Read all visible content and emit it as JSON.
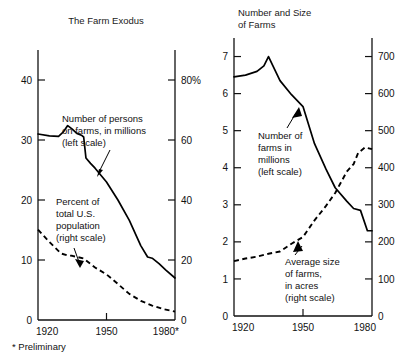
{
  "footnote": "* Preliminary",
  "chart_data": [
    {
      "id": "farm-exodus",
      "type": "line",
      "title": "The Farm Exodus",
      "xlabel": "",
      "ylabel": "",
      "xlim": [
        1920,
        1980
      ],
      "xticks": [
        1920,
        1950,
        1980
      ],
      "xticklabels": [
        "1920",
        "1950",
        "1980*"
      ],
      "ylim": [
        0,
        45
      ],
      "yticks": [
        0,
        10,
        20,
        30,
        40
      ],
      "yticklabels": [
        "0",
        "10",
        "20",
        "30",
        "40"
      ],
      "y2lim": [
        0,
        90
      ],
      "y2ticks": [
        0,
        20,
        40,
        60,
        80
      ],
      "y2ticklabels": [
        "0",
        "20",
        "40",
        "60",
        "80%"
      ],
      "grid": false,
      "legend_position": "annotations",
      "series": [
        {
          "name": "Number of persons on farms, in millions (left scale)",
          "style": "solid",
          "axis": "left",
          "x": [
            1920,
            1925,
            1929,
            1931,
            1933,
            1935,
            1937,
            1939,
            1940,
            1941,
            1943,
            1945,
            1950,
            1955,
            1960,
            1965,
            1968,
            1970,
            1973,
            1976,
            1980
          ],
          "values": [
            31.0,
            30.7,
            30.6,
            31.3,
            32.4,
            31.8,
            31.1,
            30.8,
            30.5,
            27.0,
            26.1,
            25.3,
            23.0,
            20.0,
            16.6,
            12.4,
            10.5,
            10.3,
            9.4,
            8.3,
            7.0
          ]
        },
        {
          "name": "Percent of total U.S. population (right scale)",
          "style": "dashed",
          "axis": "right",
          "x": [
            1920,
            1925,
            1930,
            1933,
            1935,
            1940,
            1945,
            1950,
            1955,
            1960,
            1965,
            1970,
            1975,
            1980
          ],
          "values": [
            30.1,
            26.0,
            22.2,
            21.5,
            21.4,
            20.5,
            17.5,
            15.2,
            12.0,
            8.7,
            6.4,
            4.8,
            3.6,
            2.8
          ]
        }
      ],
      "annotations": [
        {
          "id": "persons-label",
          "lines": [
            "Number of persons",
            "on farms, in millions",
            "(left scale)"
          ],
          "points_to": "solid series"
        },
        {
          "id": "percent-label",
          "lines": [
            "Percent of",
            "total U.S.",
            "population",
            "(right scale)"
          ],
          "points_to": "dashed series"
        }
      ]
    },
    {
      "id": "number-and-size-of-farms",
      "type": "line",
      "title": "Number and Size of Farms",
      "title_lines": [
        "Number and Size",
        "of Farms"
      ],
      "xlabel": "",
      "ylabel": "",
      "xlim": [
        1920,
        1980
      ],
      "xticks": [
        1920,
        1950,
        1980
      ],
      "xticklabels": [
        "1920",
        "1950",
        "1980"
      ],
      "ylim": [
        0,
        7.5
      ],
      "yticks": [
        0,
        1,
        2,
        3,
        4,
        5,
        6,
        7
      ],
      "yticklabels": [
        "0",
        "1",
        "2",
        "3",
        "4",
        "5",
        "6",
        "7"
      ],
      "y2lim": [
        0,
        750
      ],
      "y2ticks": [
        0,
        100,
        200,
        300,
        400,
        500,
        600,
        700
      ],
      "y2ticklabels": [
        "0",
        "100",
        "200",
        "300",
        "400",
        "500",
        "600",
        "700"
      ],
      "grid": false,
      "legend_position": "annotations",
      "series": [
        {
          "name": "Number of farms in millions (left scale)",
          "style": "solid",
          "axis": "left",
          "x": [
            1920,
            1925,
            1930,
            1933,
            1935,
            1940,
            1945,
            1950,
            1955,
            1960,
            1964,
            1969,
            1972,
            1975,
            1978,
            1980
          ],
          "values": [
            6.45,
            6.5,
            6.6,
            6.75,
            7.0,
            6.35,
            5.97,
            5.65,
            4.65,
            3.96,
            3.46,
            3.1,
            2.9,
            2.85,
            2.3,
            2.3
          ]
        },
        {
          "name": "Average size of farms, in acres (right scale)",
          "style": "dashed",
          "axis": "right",
          "x": [
            1920,
            1925,
            1930,
            1935,
            1940,
            1945,
            1950,
            1955,
            1960,
            1964,
            1969,
            1972,
            1974,
            1977,
            1980
          ],
          "values": [
            148,
            155,
            160,
            168,
            174,
            195,
            213,
            258,
            297,
            332,
            389,
            410,
            440,
            455,
            450
          ]
        }
      ],
      "annotations": [
        {
          "id": "farms-number-label",
          "lines": [
            "Number of",
            "farms in",
            "millions",
            "(left scale)"
          ],
          "points_to": "solid series"
        },
        {
          "id": "farms-size-label",
          "lines": [
            "Average size",
            "of farms,",
            "in acres",
            "(right scale)"
          ],
          "points_to": "dashed series"
        }
      ]
    }
  ]
}
